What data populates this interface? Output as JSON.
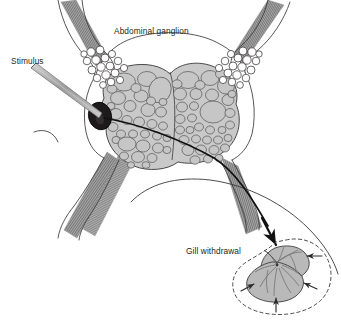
{
  "figure": {
    "kind": "biological-diagram",
    "labels": {
      "ganglion": "Abdominal ganglion",
      "stimulus": "Stimulus",
      "gill": "Gill withdrawal"
    },
    "colors": {
      "background": "#ffffff",
      "outline": "#231f20",
      "cell_fill": "#c9c9c9",
      "cell_stroke": "#4a4a4a",
      "sensory_cell_fill": "#ffffff",
      "marked_neuron_fill": "#1c1a1a",
      "nerve_trunk": "#9a9a9a",
      "nerve_trunk_stripe": "#6f6f6f",
      "axon": "#111111",
      "gill_fill": "#b9b9b9",
      "gill_stroke": "#4a4a4a",
      "dashed_contour": "#4a4a4a",
      "electrode_fill": "#b0b0b0",
      "electrode_stroke": "#5a5a5a",
      "label_text": "#231f20"
    },
    "parts": {
      "ganglion_lobes": 2,
      "nerve_trunks": 4,
      "stimulus_electrode": "micropipette",
      "marked_neuron": "dark-filled motor neuron",
      "axon_path": "from marked neuron through lower-right trunk to gill",
      "gill_arrows": 4,
      "gill_contour": "dashed withdrawal outline"
    }
  }
}
